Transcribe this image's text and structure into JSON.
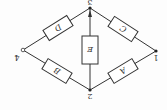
{
  "diagram": {
    "type": "bridge-circuit",
    "orientation": "rotated-180",
    "nodes": [
      {
        "id": "1",
        "label": "1",
        "x": 156,
        "y": 51,
        "style": "filled"
      },
      {
        "id": "2",
        "label": "2",
        "x": 90,
        "y": 90,
        "style": "filled"
      },
      {
        "id": "3",
        "label": "3",
        "x": 90,
        "y": 8,
        "style": "filled"
      },
      {
        "id": "4",
        "label": "4",
        "x": 23,
        "y": 50,
        "style": "open"
      }
    ],
    "components": [
      {
        "id": "A",
        "label": "A",
        "from": "1",
        "to": "2"
      },
      {
        "id": "B",
        "label": "B",
        "from": "2",
        "to": "4"
      },
      {
        "id": "C",
        "label": "C",
        "from": "1",
        "to": "3"
      },
      {
        "id": "D",
        "label": "D",
        "from": "3",
        "to": "4"
      },
      {
        "id": "E",
        "label": "E",
        "from": "2",
        "to": "3"
      }
    ]
  }
}
